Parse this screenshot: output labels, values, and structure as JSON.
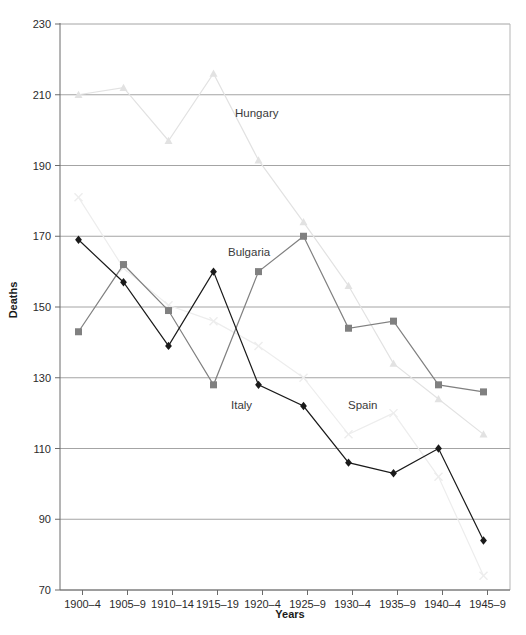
{
  "chart_data": {
    "type": "line",
    "title": "",
    "xlabel": "Years",
    "ylabel": "Deaths",
    "ylim": [
      70,
      230
    ],
    "yticks": [
      70,
      90,
      110,
      130,
      150,
      170,
      190,
      210,
      230
    ],
    "grid": true,
    "legend": "inline-labels",
    "categories": [
      "1900–4",
      "1905–9",
      "1910–14",
      "1915–19",
      "1920–4",
      "1925–9",
      "1930–4",
      "1935–9",
      "1940–4",
      "1945–9"
    ],
    "series": [
      {
        "name": "Hungary",
        "color": "#e2e2e2",
        "marker": "triangle",
        "label_x": 235,
        "label_y": 117,
        "values": [
          210,
          212,
          197,
          216,
          191.5,
          174,
          156,
          134,
          124,
          114
        ]
      },
      {
        "name": "Bulgaria",
        "color": "#808080",
        "marker": "square",
        "label_x": 228,
        "label_y": 256,
        "values": [
          143,
          162,
          149,
          128,
          160,
          170,
          144,
          146,
          128,
          126
        ]
      },
      {
        "name": "Italy",
        "color": "#1a1a1a",
        "marker": "diamond",
        "label_x": 231,
        "label_y": 409,
        "values": [
          169,
          157,
          139,
          160,
          128,
          122,
          106,
          103,
          110,
          84
        ]
      },
      {
        "name": "Spain",
        "color": "#ededed",
        "marker": "x",
        "label_x": 348,
        "label_y": 409,
        "values": [
          181,
          161,
          150.5,
          146,
          139,
          130,
          114,
          120,
          102,
          74
        ]
      }
    ]
  },
  "axes": {
    "y_title": "Deaths",
    "x_title": "Years"
  }
}
